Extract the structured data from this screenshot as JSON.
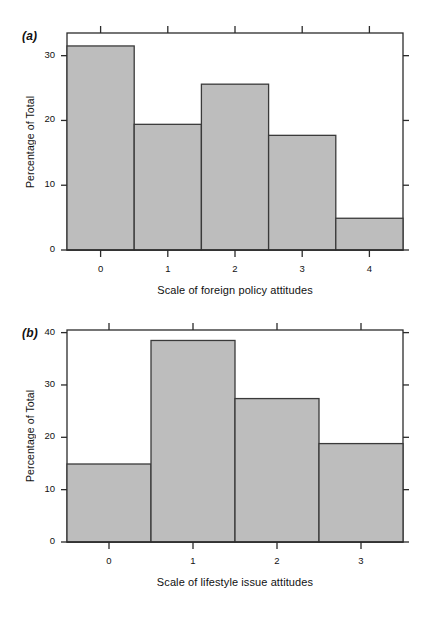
{
  "figure": {
    "background": "#ffffff",
    "bar_fill": "#bdbdbd",
    "bar_stroke": "#3a3a3a",
    "axis_color": "#2b2b2b"
  },
  "panels": [
    {
      "label": "(a)",
      "chart_data": {
        "type": "bar",
        "title": "",
        "subtitle": "",
        "xlabel": "Scale of foreign policy attitudes",
        "ylabel": "Percentage of Total",
        "categories": [
          "0",
          "1",
          "2",
          "3",
          "4"
        ],
        "values": [
          31.5,
          19.4,
          25.6,
          17.7,
          4.9
        ],
        "xlim": [
          -0.5,
          4.5
        ],
        "ylim": [
          0,
          33.5
        ],
        "xticks": [
          "0",
          "1",
          "2",
          "3",
          "4"
        ],
        "yticks": [
          "0",
          "10",
          "20",
          "30"
        ],
        "ytick_values": [
          0,
          10,
          20,
          30
        ],
        "grid": false,
        "legend": "none",
        "box": true,
        "tick_direction": "outward",
        "annotations": []
      }
    },
    {
      "label": "(b)",
      "chart_data": {
        "type": "bar",
        "title": "",
        "subtitle": "",
        "xlabel": "Scale of lifestyle issue attitudes",
        "ylabel": "Percentage of Total",
        "categories": [
          "0",
          "1",
          "2",
          "3"
        ],
        "values": [
          14.9,
          38.5,
          27.4,
          18.8
        ],
        "xlim": [
          -0.5,
          3.5
        ],
        "ylim": [
          0,
          40.5
        ],
        "xticks": [
          "0",
          "1",
          "2",
          "3"
        ],
        "yticks": [
          "0",
          "10",
          "20",
          "30",
          "40"
        ],
        "ytick_values": [
          0,
          10,
          20,
          30,
          40
        ],
        "grid": false,
        "legend": "none",
        "box": true,
        "tick_direction": "outward",
        "annotations": []
      }
    }
  ]
}
